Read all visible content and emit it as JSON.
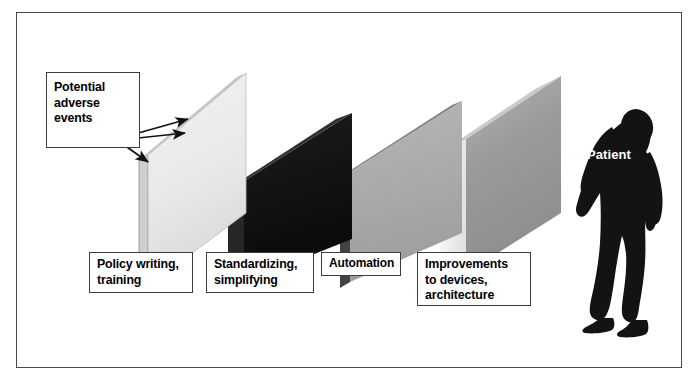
{
  "figure": {
    "frame_color": "#4a4a4a",
    "background": "#ffffff"
  },
  "callouts": {
    "hazard": {
      "label": "Potential\nadverse\nevents",
      "arrow_count": 3
    },
    "patient": {
      "label": "Patient",
      "text_color": "#ffffff",
      "silhouette_color": "#111111"
    }
  },
  "barriers": [
    {
      "id": "barrier-1",
      "label": "Policy writing,\ntraining",
      "face_color": "#e9e9e9",
      "edge_color": "#d2d2d2",
      "order": 1
    },
    {
      "id": "barrier-2",
      "label": "Standardizing,\nsimplifying",
      "face_color": "#151515",
      "edge_color": "#2b2b2b",
      "order": 2
    },
    {
      "id": "barrier-3",
      "label": "Automation",
      "face_color": "#ababab",
      "edge_color": "#3a3a3a",
      "order": 3
    },
    {
      "id": "barrier-4",
      "label": "Improvements\nto devices,\narchitecture",
      "face_color": "#9b9b9b",
      "edge_color": "#f2f2f2",
      "order": 4
    }
  ]
}
